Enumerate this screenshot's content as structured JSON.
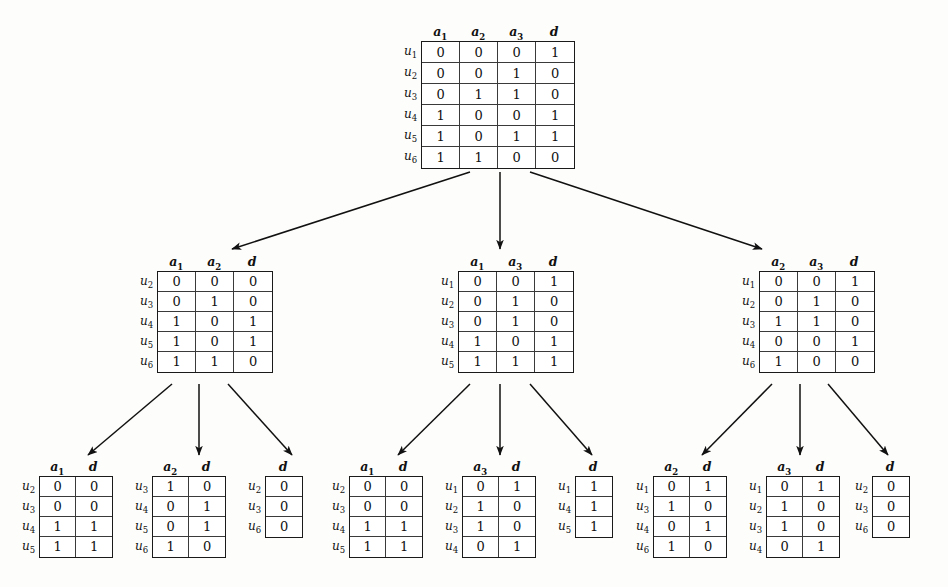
{
  "figure": {
    "kind": "decision-table-decomposition-tree",
    "levels": 3,
    "attribute_symbols": [
      "a1",
      "a2",
      "a3",
      "d"
    ],
    "object_symbols": [
      "u1",
      "u2",
      "u3",
      "u4",
      "u5",
      "u6"
    ],
    "edge_style": "solid-line-with-filled-arrowhead",
    "edge_color": "#111111",
    "border_color": "#1a1a1a"
  },
  "nodes": [
    {
      "id": "root",
      "level": 0,
      "headers": [
        "a₁",
        "a₂",
        "a₃",
        "d"
      ],
      "row_labels": [
        "u₁",
        "u₂",
        "u₃",
        "u₄",
        "u₅",
        "u₆"
      ],
      "rows": [
        [
          "0",
          "0",
          "0",
          "1"
        ],
        [
          "0",
          "0",
          "1",
          "0"
        ],
        [
          "0",
          "1",
          "1",
          "0"
        ],
        [
          "1",
          "0",
          "0",
          "1"
        ],
        [
          "1",
          "0",
          "1",
          "1"
        ],
        [
          "1",
          "1",
          "0",
          "0"
        ]
      ]
    },
    {
      "id": "L1-left",
      "level": 1,
      "headers": [
        "a₁",
        "a₂",
        "d"
      ],
      "row_labels": [
        "u₂",
        "u₃",
        "u₄",
        "u₅",
        "u₆"
      ],
      "rows": [
        [
          "0",
          "0",
          "0"
        ],
        [
          "0",
          "1",
          "0"
        ],
        [
          "1",
          "0",
          "1"
        ],
        [
          "1",
          "0",
          "1"
        ],
        [
          "1",
          "1",
          "0"
        ]
      ]
    },
    {
      "id": "L1-center",
      "level": 1,
      "headers": [
        "a₁",
        "a₃",
        "d"
      ],
      "row_labels": [
        "u₁",
        "u₂",
        "u₃",
        "u₄",
        "u₅"
      ],
      "rows": [
        [
          "0",
          "0",
          "1"
        ],
        [
          "0",
          "1",
          "0"
        ],
        [
          "0",
          "1",
          "0"
        ],
        [
          "1",
          "0",
          "1"
        ],
        [
          "1",
          "1",
          "1"
        ]
      ]
    },
    {
      "id": "L1-right",
      "level": 1,
      "headers": [
        "a₂",
        "a₃",
        "d"
      ],
      "row_labels": [
        "u₁",
        "u₂",
        "u₃",
        "u₄",
        "u₆"
      ],
      "rows": [
        [
          "0",
          "0",
          "1"
        ],
        [
          "0",
          "1",
          "0"
        ],
        [
          "1",
          "1",
          "0"
        ],
        [
          "0",
          "0",
          "1"
        ],
        [
          "1",
          "0",
          "0"
        ]
      ]
    },
    {
      "id": "L2-1",
      "level": 2,
      "headers": [
        "a₁",
        "d"
      ],
      "row_labels": [
        "u₂",
        "u₃",
        "u₄",
        "u₅"
      ],
      "rows": [
        [
          "0",
          "0"
        ],
        [
          "0",
          "0"
        ],
        [
          "1",
          "1"
        ],
        [
          "1",
          "1"
        ]
      ]
    },
    {
      "id": "L2-2",
      "level": 2,
      "headers": [
        "a₂",
        "d"
      ],
      "row_labels": [
        "u₃",
        "u₄",
        "u₅",
        "u₆"
      ],
      "rows": [
        [
          "1",
          "0"
        ],
        [
          "0",
          "1"
        ],
        [
          "0",
          "1"
        ],
        [
          "1",
          "0"
        ]
      ]
    },
    {
      "id": "L2-3",
      "level": 2,
      "headers": [
        "d"
      ],
      "row_labels": [
        "u₂",
        "u₃",
        "u₆"
      ],
      "rows": [
        [
          "0"
        ],
        [
          "0"
        ],
        [
          "0"
        ]
      ]
    },
    {
      "id": "L2-4",
      "level": 2,
      "headers": [
        "a₁",
        "d"
      ],
      "row_labels": [
        "u₂",
        "u₃",
        "u₄",
        "u₅"
      ],
      "rows": [
        [
          "0",
          "0"
        ],
        [
          "0",
          "0"
        ],
        [
          "1",
          "1"
        ],
        [
          "1",
          "1"
        ]
      ]
    },
    {
      "id": "L2-5",
      "level": 2,
      "headers": [
        "a₃",
        "d"
      ],
      "row_labels": [
        "u₁",
        "u₂",
        "u₃",
        "u₄"
      ],
      "rows": [
        [
          "0",
          "1"
        ],
        [
          "1",
          "0"
        ],
        [
          "1",
          "0"
        ],
        [
          "0",
          "1"
        ]
      ]
    },
    {
      "id": "L2-6",
      "level": 2,
      "headers": [
        "d"
      ],
      "row_labels": [
        "u₁",
        "u₄",
        "u₅"
      ],
      "rows": [
        [
          "1"
        ],
        [
          "1"
        ],
        [
          "1"
        ]
      ]
    },
    {
      "id": "L2-7",
      "level": 2,
      "headers": [
        "a₂",
        "d"
      ],
      "row_labels": [
        "u₁",
        "u₃",
        "u₄",
        "u₆"
      ],
      "rows": [
        [
          "0",
          "1"
        ],
        [
          "1",
          "0"
        ],
        [
          "0",
          "1"
        ],
        [
          "1",
          "0"
        ]
      ]
    },
    {
      "id": "L2-8",
      "level": 2,
      "headers": [
        "a₃",
        "d"
      ],
      "row_labels": [
        "u₁",
        "u₂",
        "u₃",
        "u₄"
      ],
      "rows": [
        [
          "0",
          "1"
        ],
        [
          "1",
          "0"
        ],
        [
          "1",
          "0"
        ],
        [
          "0",
          "1"
        ]
      ]
    },
    {
      "id": "L2-9",
      "level": 2,
      "headers": [
        "d"
      ],
      "row_labels": [
        "u₂",
        "u₃",
        "u₆"
      ],
      "rows": [
        [
          "0"
        ],
        [
          "0"
        ],
        [
          "0"
        ]
      ]
    }
  ]
}
